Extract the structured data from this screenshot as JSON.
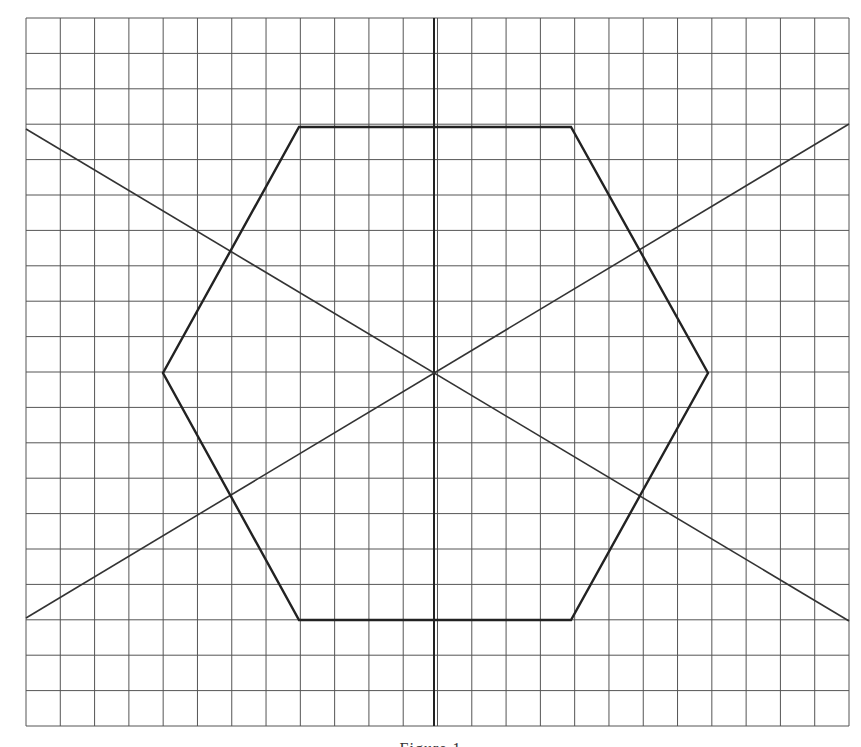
{
  "figure": {
    "type": "geometric-construction",
    "grid": {
      "x0": 26,
      "y0": 18,
      "x1": 849,
      "y1": 726,
      "cols": 24,
      "rows": 20,
      "line_color": "#555555"
    },
    "axis": {
      "x": 434,
      "y_top": 18,
      "y_bottom": 726,
      "color": "#222222"
    },
    "hexagon": {
      "vertices": [
        [
          299,
          127
        ],
        [
          571,
          127
        ],
        [
          708,
          373
        ],
        [
          571,
          620
        ],
        [
          299,
          620
        ],
        [
          163,
          373
        ]
      ],
      "stroke": "#222222",
      "stroke_width": 2.4
    },
    "diagonals": [
      {
        "from": [
          26,
          129
        ],
        "to": [
          849,
          621
        ]
      },
      {
        "from": [
          26,
          618
        ],
        "to": [
          849,
          124
        ]
      }
    ],
    "center": [
      434,
      373
    ]
  },
  "caption": {
    "text": "Figure 1"
  }
}
